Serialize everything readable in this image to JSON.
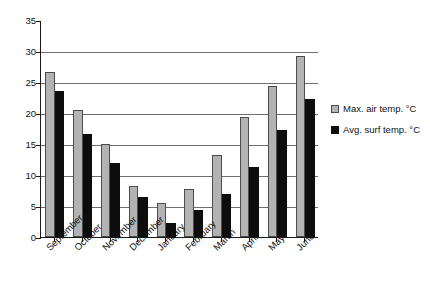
{
  "chart_data": {
    "type": "bar",
    "title": "",
    "xlabel": "",
    "ylabel": "",
    "ylim": [
      0,
      35
    ],
    "yticks": [
      0,
      5,
      10,
      15,
      20,
      25,
      30,
      35
    ],
    "grid": true,
    "legend_position": "right",
    "categories": [
      "September",
      "October",
      "November",
      "December",
      "January",
      "February",
      "March",
      "April",
      "May",
      "June"
    ],
    "series": [
      {
        "name": "Max. air temp. °C",
        "color": "#b3b3b3",
        "values": [
          26.6,
          20.5,
          15.0,
          8.2,
          5.5,
          7.7,
          13.2,
          19.3,
          24.3,
          29.2
        ]
      },
      {
        "name": "Avg. surf temp. °C",
        "color": "#0d0d0d",
        "values": [
          23.5,
          16.6,
          12.0,
          6.5,
          2.2,
          4.4,
          6.9,
          11.3,
          17.3,
          22.3
        ]
      }
    ]
  },
  "legend": {
    "items": [
      {
        "label": "Max. air temp. °C",
        "swatch": "max"
      },
      {
        "label": "Avg. surf temp. °C",
        "swatch": "avg"
      }
    ]
  }
}
